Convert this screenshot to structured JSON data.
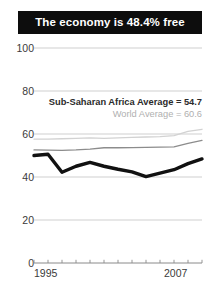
{
  "title": {
    "text": "The economy is 48.4% free"
  },
  "annotations": {
    "sub_saharan": "Sub-Saharan Africa Average = 54.7",
    "world": "World Average = 60.6"
  },
  "axis": {
    "y_ticks": [
      "100",
      "80",
      "60",
      "40",
      "20",
      "0"
    ],
    "x_start": "1995",
    "x_end": "2007"
  },
  "colors": {
    "title_background": "#0d0d0d",
    "title_text": "#ffffff",
    "country_line": "#111111",
    "sub_saharan_line": "#8c8c8c",
    "world_line": "#d2d2d2",
    "gridline": "#c9c9c9",
    "tick_text": "#3a3a3a"
  },
  "chart_data": {
    "type": "line",
    "title": "The economy is 48.4% free",
    "xlabel": "",
    "ylabel": "",
    "ylim": [
      0,
      100
    ],
    "xlim": [
      1995,
      2007
    ],
    "grid": true,
    "legend_position": "none",
    "x": [
      1995,
      1996,
      1997,
      1998,
      1999,
      2000,
      2001,
      2002,
      2003,
      2004,
      2005,
      2006,
      2007
    ],
    "series": [
      {
        "name": "Country score",
        "style": "thick-black",
        "values": [
          50.0,
          50.6,
          42.2,
          45.0,
          46.8,
          45.0,
          43.6,
          42.4,
          40.2,
          41.8,
          43.4,
          46.2,
          48.4
        ]
      },
      {
        "name": "Sub-Saharan Africa Average",
        "style": "medium-gray",
        "reference_value": 54.7,
        "values": [
          52.6,
          52.5,
          52.4,
          52.6,
          53.0,
          53.6,
          53.6,
          53.7,
          53.8,
          53.9,
          54.0,
          55.6,
          57.0
        ]
      },
      {
        "name": "World Average",
        "style": "light-gray",
        "reference_value": 60.6,
        "values": [
          57.6,
          57.6,
          57.8,
          58.0,
          58.2,
          58.0,
          58.2,
          58.4,
          58.6,
          58.8,
          59.2,
          61.2,
          62.2
        ]
      }
    ],
    "gridline_values": [
      0,
      20,
      40,
      60,
      80,
      100
    ]
  }
}
